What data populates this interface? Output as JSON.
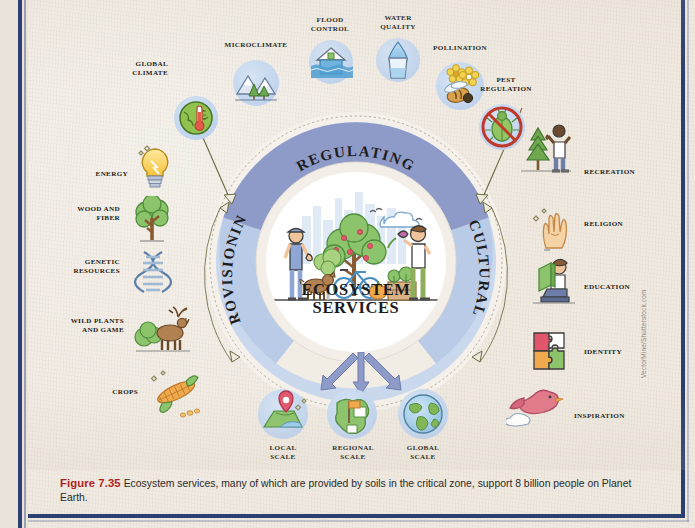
{
  "figure": {
    "number": "Figure 7.35",
    "caption": " Ecosystem services, many of which are provided by soils in the critical zone, support 8 billion people on Planet Earth.",
    "credit": "VectorMine/Shutterstock.com"
  },
  "center": {
    "title_line1": "Ecosystem",
    "title_line2": "Services",
    "scene_icon": "community-garden-scene-icon"
  },
  "ring": {
    "segments": [
      {
        "label": "Regulating",
        "color": "#8e9bc8",
        "position": "top"
      },
      {
        "label": "Provisioning",
        "color": "#b9cbe7",
        "position": "left"
      },
      {
        "label": "Cultural",
        "color": "#b9cbe7",
        "position": "right"
      }
    ],
    "outer_band_color": "#f4f0e9",
    "arc_line_color": "#6e6a44"
  },
  "services": {
    "regulating": [
      {
        "label": "Global\nClimate",
        "icon": "globe-thermometer-icon"
      },
      {
        "label": "Microclimate",
        "icon": "mountains-trees-icon"
      },
      {
        "label": "Flood\nControl",
        "icon": "flooded-house-icon"
      },
      {
        "label": "Water\nQuality",
        "icon": "water-glass-drop-icon"
      },
      {
        "label": "Pollination",
        "icon": "bee-flowers-icon"
      },
      {
        "label": "Pest\nRegulation",
        "icon": "no-pest-beetle-icon"
      }
    ],
    "provisioning": [
      {
        "label": "Energy",
        "icon": "lightbulb-icon"
      },
      {
        "label": "Wood and\nFiber",
        "icon": "tree-icon"
      },
      {
        "label": "Genetic\nResources",
        "icon": "dna-helix-icon"
      },
      {
        "label": "Wild Plants\nand Game",
        "icon": "deer-bush-icon"
      },
      {
        "label": "Crops",
        "icon": "corn-cob-icon"
      }
    ],
    "cultural": [
      {
        "label": "Recreation",
        "icon": "hiker-tree-icon"
      },
      {
        "label": "Religion",
        "icon": "praying-hand-icon"
      },
      {
        "label": "Education",
        "icon": "person-reading-book-icon"
      },
      {
        "label": "Identity",
        "icon": "puzzle-pieces-icon"
      },
      {
        "label": "Inspiration",
        "icon": "bird-cloud-icon"
      }
    ]
  },
  "scales": [
    {
      "label": "Local\nScale",
      "icon": "map-pin-terrain-icon"
    },
    {
      "label": "Regional\nScale",
      "icon": "region-flag-map-icon"
    },
    {
      "label": "Global\nScale",
      "icon": "earth-globe-icon"
    }
  ],
  "colors": {
    "paper": "#efe9e0",
    "rule_blue": "#2c3f72",
    "bubble_blue": "#c3d6ee",
    "periwinkle": "#8e9bc8",
    "caption_red": "#b01f24"
  }
}
